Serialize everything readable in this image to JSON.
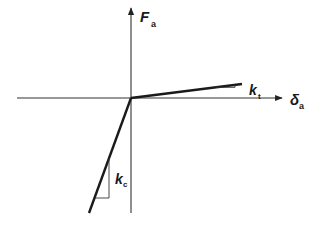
{
  "diagram": {
    "type": "bilinear force-displacement relation",
    "axes": {
      "y": {
        "symbol": "F",
        "subscript": "a"
      },
      "x": {
        "symbol": "δ",
        "subscript": "a"
      }
    },
    "branches": [
      {
        "name": "tension",
        "slope_label": {
          "symbol": "k",
          "subscript": "t"
        }
      },
      {
        "name": "compression",
        "slope_label": {
          "symbol": "k",
          "subscript": "c"
        }
      }
    ],
    "colors": {
      "line": "#1a1a1a",
      "axis": "#333333",
      "background": "#ffffff"
    }
  }
}
